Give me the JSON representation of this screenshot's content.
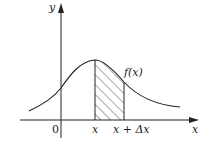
{
  "diagram": {
    "type": "function-area-element",
    "axes": {
      "x_label": "x",
      "y_label": "y",
      "origin_label": "0"
    },
    "curve_label": "f(x)",
    "strip": {
      "left_label": "x",
      "right_label": "x + Δx",
      "fill": "hatched"
    },
    "colors": {
      "line": "#222222",
      "background": "#ffffff"
    }
  }
}
